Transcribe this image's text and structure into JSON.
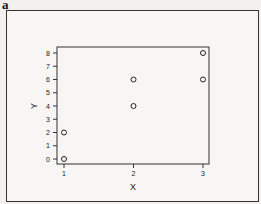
{
  "panel_label": "a",
  "chart_data": {
    "type": "scatter",
    "title": "",
    "xlabel": "X",
    "ylabel": "Y",
    "x_ticks": [
      1,
      2,
      3
    ],
    "y_ticks": [
      0,
      1,
      2,
      3,
      4,
      5,
      6,
      7,
      8
    ],
    "xlim": [
      0.96,
      3.03
    ],
    "ylim": [
      -0.4,
      8.5
    ],
    "grid": false,
    "legend": null,
    "marker": "open-circle",
    "points": [
      {
        "x": 1,
        "y": 0
      },
      {
        "x": 1,
        "y": 2
      },
      {
        "x": 2,
        "y": 4
      },
      {
        "x": 2,
        "y": 6
      },
      {
        "x": 3,
        "y": 6
      },
      {
        "x": 3,
        "y": 8
      }
    ]
  }
}
